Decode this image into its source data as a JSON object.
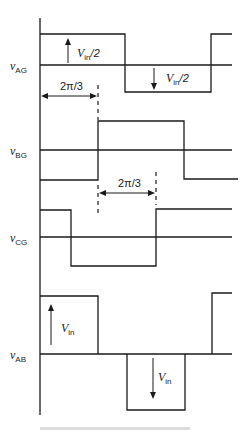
{
  "diagram": {
    "type": "waveform-timing-diagram",
    "signals": [
      {
        "id": "vAG",
        "label_main": "v",
        "label_sub": "AG",
        "waveform": "square",
        "amplitude_label_main": "V",
        "amplitude_label_sub": "in",
        "amplitude_label_suffix": "/2"
      },
      {
        "id": "vBG",
        "label_main": "v",
        "label_sub": "BG",
        "waveform": "square",
        "phase_shift": "2π/3"
      },
      {
        "id": "vCG",
        "label_main": "v",
        "label_sub": "CG",
        "waveform": "square",
        "phase_shift": "4π/3"
      },
      {
        "id": "vAB",
        "label_main": "v",
        "label_sub": "AB",
        "waveform": "quasi-square",
        "amplitude_label_main": "V",
        "amplitude_label_sub": "in"
      }
    ],
    "annotations": {
      "phase1": "2π/3",
      "phase2": "2π/3",
      "vag_up": {
        "main": "V",
        "sub": "in",
        "suffix": "/2"
      },
      "vag_down": {
        "main": "V",
        "sub": "in",
        "suffix": "/2"
      },
      "vab_up": {
        "main": "V",
        "sub": "in"
      },
      "vab_down": {
        "main": "V",
        "sub": "in"
      }
    }
  }
}
